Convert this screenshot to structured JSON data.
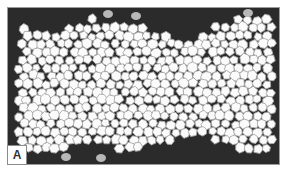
{
  "figure": {
    "panel_label": "A",
    "colors": {
      "background": "#2b2b2b",
      "cell_fill": "#fbfbfb",
      "cell_border": "#a8a8a8",
      "gray_cell": "#b8b8b8"
    }
  }
}
